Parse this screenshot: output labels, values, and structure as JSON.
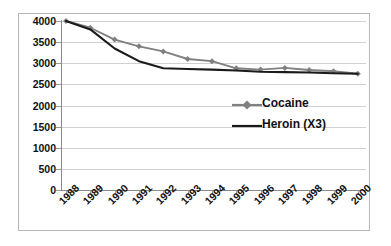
{
  "chart_data": {
    "type": "line",
    "title": "",
    "xlabel": "",
    "ylabel": "",
    "categories": [
      "1988",
      "1989",
      "1990",
      "1991",
      "1992",
      "1993",
      "1994",
      "1995",
      "1996",
      "1997",
      "1998",
      "1999",
      "2000"
    ],
    "series": [
      {
        "name": "Cocaine",
        "marker": "diamond",
        "color": "#808080",
        "values": [
          4000,
          3840,
          3560,
          3400,
          3280,
          3100,
          3050,
          2880,
          2850,
          2890,
          2840,
          2810,
          2750
        ]
      },
      {
        "name": "Heroin (X3)",
        "marker": "none",
        "color": "#1a1a1a",
        "values": [
          4000,
          3800,
          3350,
          3050,
          2880,
          2865,
          2850,
          2830,
          2800,
          2790,
          2780,
          2765,
          2750
        ]
      }
    ],
    "ylim": [
      0,
      4000
    ],
    "yticks": [
      0,
      500,
      1000,
      1500,
      2000,
      2500,
      3000,
      3500,
      4000
    ],
    "ytick_labels": [
      "0",
      "500",
      "1000",
      "1500",
      "2000",
      "2500",
      "3000",
      "3500",
      "4000"
    ],
    "grid": true,
    "legend_position": "center-right"
  },
  "legend": {
    "entries": [
      {
        "label": "Cocaine"
      },
      {
        "label": "Heroin (X3)"
      }
    ]
  },
  "colors": {
    "cocaine": "#808080",
    "heroin": "#1a1a1a",
    "gridline": "#d0d0d0",
    "axis": "#8a8a8a",
    "frame": "#b6b6b6",
    "text": "#111111",
    "background": "#ffffff"
  }
}
